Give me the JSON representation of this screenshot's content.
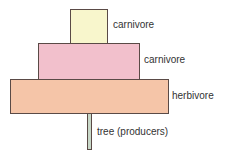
{
  "diagram": {
    "type": "pyramid of numbers",
    "levels": [
      {
        "label": "carnivore",
        "color": "#f8f6cc",
        "rank": "top"
      },
      {
        "label": "carnivore",
        "color": "#f2c0cc",
        "rank": "secondary"
      },
      {
        "label": "herbivore",
        "color": "#f5c5a8",
        "rank": "primary"
      },
      {
        "label": "tree (producers)",
        "color": "#c8d8c8",
        "rank": "producer"
      }
    ]
  }
}
